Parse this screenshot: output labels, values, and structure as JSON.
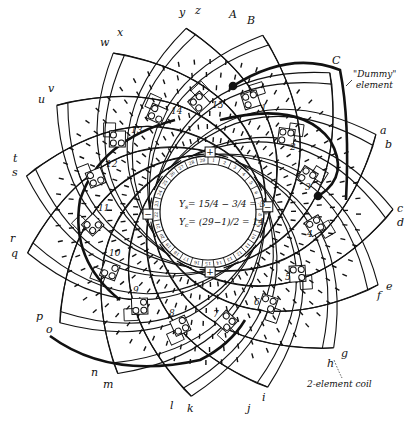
{
  "diagram": {
    "type": "armature winding diagram",
    "center": {
      "x": 208,
      "y": 212
    },
    "outer_labels": [
      {
        "text": "A",
        "x": 229,
        "y": 18
      },
      {
        "text": "B",
        "x": 247,
        "y": 24
      },
      {
        "text": "C",
        "x": 332,
        "y": 64
      },
      {
        "text": "a",
        "x": 380,
        "y": 134
      },
      {
        "text": "b",
        "x": 385,
        "y": 148
      },
      {
        "text": "c",
        "x": 397,
        "y": 212
      },
      {
        "text": "d",
        "x": 397,
        "y": 226
      },
      {
        "text": "e",
        "x": 386,
        "y": 290
      },
      {
        "text": "f",
        "x": 377,
        "y": 299
      },
      {
        "text": "g",
        "x": 341,
        "y": 357
      },
      {
        "text": "h",
        "x": 327,
        "y": 367
      },
      {
        "text": "i",
        "x": 262,
        "y": 401
      },
      {
        "text": "j",
        "x": 247,
        "y": 412
      },
      {
        "text": "k",
        "x": 187,
        "y": 412
      },
      {
        "text": "l",
        "x": 170,
        "y": 409
      },
      {
        "text": "m",
        "x": 103,
        "y": 388
      },
      {
        "text": "n",
        "x": 91,
        "y": 376
      },
      {
        "text": "o",
        "x": 46,
        "y": 333
      },
      {
        "text": "p",
        "x": 36,
        "y": 320
      },
      {
        "text": "q",
        "x": 11,
        "y": 257
      },
      {
        "text": "r",
        "x": 10,
        "y": 242
      },
      {
        "text": "s",
        "x": 12,
        "y": 176
      },
      {
        "text": "t",
        "x": 13,
        "y": 162
      },
      {
        "text": "u",
        "x": 38,
        "y": 103
      },
      {
        "text": "v",
        "x": 48,
        "y": 92
      },
      {
        "text": "w",
        "x": 100,
        "y": 46
      },
      {
        "text": "x",
        "x": 117,
        "y": 36
      },
      {
        "text": "y",
        "x": 179,
        "y": 16
      },
      {
        "text": "z",
        "x": 195,
        "y": 14
      }
    ],
    "coil_numbers": [
      {
        "text": "1",
        "x": 261,
        "y": 111
      },
      {
        "text": "2",
        "x": 290,
        "y": 150
      },
      {
        "text": "3",
        "x": 305,
        "y": 190
      },
      {
        "text": "4",
        "x": 307,
        "y": 237
      },
      {
        "text": "5",
        "x": 285,
        "y": 280
      },
      {
        "text": "6",
        "x": 254,
        "y": 305
      },
      {
        "text": "7",
        "x": 213,
        "y": 317
      },
      {
        "text": "8",
        "x": 169,
        "y": 316
      },
      {
        "text": "9",
        "x": 133,
        "y": 293
      },
      {
        "text": "10",
        "x": 109,
        "y": 256
      },
      {
        "text": "11",
        "x": 98,
        "y": 211
      },
      {
        "text": "12",
        "x": 106,
        "y": 167
      },
      {
        "text": "13",
        "x": 131,
        "y": 133
      },
      {
        "text": "14",
        "x": 171,
        "y": 114
      },
      {
        "text": "15",
        "x": 212,
        "y": 108
      }
    ],
    "commutator": {
      "segments": 29,
      "segment_labels": [
        "1",
        "2",
        "3",
        "4",
        "5",
        "6",
        "7",
        "8",
        "9",
        "10",
        "11",
        "12",
        "13",
        "14",
        "15",
        "16",
        "17",
        "18",
        "19",
        "20",
        "21",
        "22",
        "23",
        "24",
        "25",
        "26",
        "27",
        "28",
        "29"
      ],
      "brush_markers": [
        {
          "symbol": "+",
          "angle_deg": -88
        },
        {
          "symbol": "−",
          "angle_deg": -5
        },
        {
          "symbol": "+",
          "angle_deg": 88
        },
        {
          "symbol": "−",
          "angle_deg": 178
        }
      ]
    },
    "equations": {
      "ys_lhs": "Y",
      "ys_sub": "s",
      "ys_rhs": "= 15/4 − 3/4 = 3",
      "yc_lhs": "Y",
      "yc_sub": "c",
      "yc_rhs": "= (29−1)/2 = 14"
    },
    "annotations": {
      "dummy_line1": "\"Dummy\"",
      "dummy_line2": "element",
      "two_element": "2-element coil"
    },
    "colors": {
      "ink": "#111111",
      "paper": "#ffffff"
    }
  }
}
